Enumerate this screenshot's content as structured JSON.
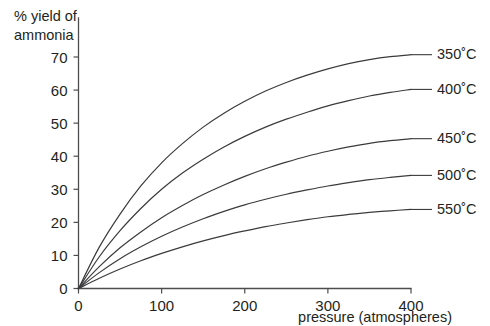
{
  "chart_data": {
    "type": "line",
    "title": "",
    "xlabel": "pressure (atmospheres)",
    "ylabel": "% yield of ammonia",
    "ylabel_line1": "% yield of",
    "ylabel_line2": "ammonia",
    "xlim": [
      0,
      400
    ],
    "ylim": [
      0,
      70
    ],
    "xticks": [
      0,
      100,
      200,
      300,
      400
    ],
    "xtick_labels": [
      "0",
      "100",
      "200",
      "300",
      "400"
    ],
    "yticks": [
      0,
      10,
      20,
      30,
      40,
      50,
      60,
      70
    ],
    "ytick_labels": [
      "0",
      "10",
      "20",
      "30",
      "40",
      "50",
      "60",
      "70"
    ],
    "grid": false,
    "legend_position": "right-of-curve-ends",
    "line_color": "#3b3b3d",
    "axis_color": "#4d4d4f",
    "background_color": "#ffffff",
    "x": [
      0,
      25,
      50,
      75,
      100,
      125,
      150,
      175,
      200,
      225,
      250,
      275,
      300,
      325,
      350,
      375,
      400
    ],
    "series": [
      {
        "name": "350˚C",
        "label": "350˚C",
        "temperature_c": 350,
        "values": [
          0,
          12.5,
          22.5,
          31.0,
          38.0,
          43.8,
          48.8,
          53.0,
          56.6,
          59.7,
          62.3,
          64.5,
          66.4,
          68.0,
          69.2,
          70.1,
          70.7
        ]
      },
      {
        "name": "400˚C",
        "label": "400˚C",
        "temperature_c": 400,
        "values": [
          0,
          9.6,
          17.5,
          24.2,
          30.0,
          34.9,
          39.1,
          42.8,
          46.0,
          48.8,
          51.2,
          53.3,
          55.2,
          56.8,
          58.2,
          59.3,
          60.2
        ]
      },
      {
        "name": "450˚C",
        "label": "450˚C",
        "temperature_c": 450,
        "values": [
          0,
          6.6,
          12.3,
          17.1,
          21.4,
          25.1,
          28.4,
          31.3,
          33.9,
          36.2,
          38.2,
          40.0,
          41.5,
          42.8,
          43.9,
          44.7,
          45.3
        ]
      },
      {
        "name": "500˚C",
        "label": "500˚C",
        "temperature_c": 500,
        "values": [
          0,
          4.8,
          9.0,
          12.6,
          15.8,
          18.6,
          21.1,
          23.3,
          25.3,
          27.0,
          28.5,
          29.8,
          31.0,
          32.0,
          32.9,
          33.6,
          34.2
        ]
      },
      {
        "name": "550˚C",
        "label": "550˚C",
        "temperature_c": 550,
        "values": [
          0,
          3.1,
          5.9,
          8.4,
          10.6,
          12.6,
          14.4,
          16.0,
          17.4,
          18.7,
          19.8,
          20.8,
          21.7,
          22.4,
          23.0,
          23.5,
          23.9
        ]
      }
    ]
  }
}
